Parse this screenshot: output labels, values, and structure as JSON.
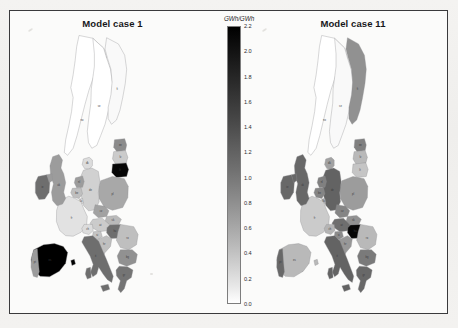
{
  "figure": {
    "colorbar": {
      "title": "GWh/GWh",
      "ticks": [
        "2.2",
        "2.0",
        "1.8",
        "1.6",
        "1.4",
        "1.2",
        "1.0",
        "0.8",
        "0.6",
        "0.4",
        "0.2",
        "0.0"
      ],
      "vmin": 0.0,
      "vmax": 2.2,
      "cmap": "gray-reversed-black-high"
    },
    "panels": [
      {
        "title": "Model case 1"
      },
      {
        "title": "Model case 11"
      }
    ]
  },
  "chart_data": {
    "type": "heatmap",
    "title": "",
    "subtitle": "",
    "xlabel": "",
    "ylabel": "",
    "legend_position": "center",
    "colorbar_label": "GWh/GWh",
    "colorbar_range": [
      0.0,
      2.2
    ],
    "colorbar_ticks": [
      0.0,
      0.2,
      0.4,
      0.6,
      0.8,
      1.0,
      1.2,
      1.4,
      1.6,
      1.8,
      2.0,
      2.2
    ],
    "grid": false,
    "panels": [
      {
        "name": "Model case 1",
        "categories": [
          "NO",
          "SE",
          "FI",
          "DK",
          "EE",
          "LV",
          "LT",
          "PL",
          "DE",
          "NL",
          "BE",
          "LU",
          "FR",
          "CZ",
          "SK",
          "AT",
          "CH",
          "HU",
          "SI",
          "HR",
          "RO",
          "BG",
          "GR",
          "IT",
          "ES",
          "PT",
          "IE",
          "UK"
        ],
        "values": [
          0.0,
          0.0,
          0.05,
          0.3,
          1.0,
          0.45,
          2.15,
          0.75,
          0.4,
          0.85,
          0.55,
          0.3,
          0.25,
          0.8,
          0.6,
          0.45,
          0.3,
          1.25,
          0.5,
          0.55,
          0.55,
          0.95,
          1.2,
          1.25,
          2.2,
          0.85,
          1.25,
          0.85
        ]
      },
      {
        "name": "Model case 11",
        "categories": [
          "NO",
          "SE",
          "FI",
          "DK",
          "EE",
          "LV",
          "LT",
          "PL",
          "DE",
          "NL",
          "BE",
          "LU",
          "FR",
          "CZ",
          "SK",
          "AT",
          "CH",
          "HU",
          "SI",
          "HR",
          "RO",
          "BG",
          "GR",
          "IT",
          "ES",
          "PT",
          "IE",
          "UK"
        ],
        "values": [
          0.0,
          0.05,
          0.95,
          0.8,
          1.1,
          0.6,
          0.5,
          0.85,
          1.35,
          1.1,
          1.05,
          0.7,
          0.45,
          1.05,
          0.95,
          1.25,
          0.65,
          2.15,
          1.0,
          0.9,
          0.6,
          1.15,
          1.3,
          1.35,
          0.6,
          1.3,
          1.3,
          1.3
        ]
      }
    ]
  }
}
